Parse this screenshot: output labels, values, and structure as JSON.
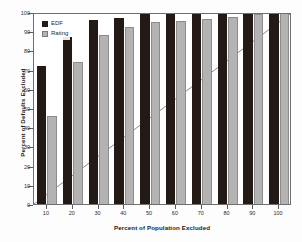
{
  "chart_data": {
    "type": "bar",
    "title": "",
    "subtitle": "",
    "xlabel": "Percent of Population Excluded",
    "ylabel": "Percent of Defaults Excluded",
    "categories": [
      "10",
      "20",
      "30",
      "40",
      "50",
      "60",
      "70",
      "80",
      "90",
      "100"
    ],
    "series": [
      {
        "name": "EDF",
        "color": "#231a16",
        "values": [
          72,
          87,
          96,
          97,
          100,
          100,
          100,
          100,
          100,
          100
        ]
      },
      {
        "name": "Rating",
        "color": "#b3b3b3",
        "values": [
          46,
          74,
          88,
          92,
          95,
          95.5,
          96.5,
          97.5,
          99,
          100
        ]
      }
    ],
    "reference_line": {
      "name": "45-degree diagonal",
      "from": [
        0,
        0
      ],
      "to": [
        100,
        100
      ],
      "color": "#8a8a8a"
    },
    "ylim": [
      0,
      100
    ],
    "yticks": [
      0,
      10,
      20,
      30,
      40,
      50,
      60,
      70,
      80,
      90,
      100
    ],
    "ytick_labels": [
      "0",
      "10",
      "20",
      "30",
      "40",
      "50",
      "60",
      "70",
      "80",
      "90",
      "100"
    ],
    "xtick_labels": [
      "10",
      "20",
      "30",
      "40",
      "50",
      "60",
      "70",
      "80",
      "90",
      "100"
    ],
    "grid": false,
    "legend_position": "top-left"
  },
  "legend": {
    "items": [
      {
        "label": "EDF"
      },
      {
        "label": "Rating"
      }
    ]
  },
  "axes": {
    "x_title": "Percent of Population Excluded",
    "y_title": "Percent of Defaults Excluded"
  },
  "colors": {
    "edf": "#231a16",
    "rating": "#b3b3b3",
    "frame": "#6e6e6e",
    "diagonal": "#8a8a8a",
    "background": "#ffffff"
  }
}
